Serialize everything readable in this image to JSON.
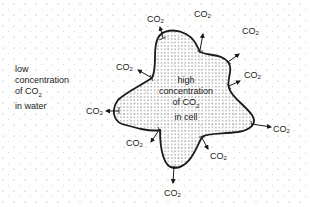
{
  "diagram": {
    "outside_label": {
      "lines": [
        "low",
        "concentration",
        "of CO",
        "in water"
      ],
      "subscript": "2"
    },
    "inside_label": {
      "lines": [
        "high",
        "concentration",
        "of CO",
        "in cell"
      ],
      "subscript": "2"
    },
    "molecule_label": "CO",
    "molecule_subscript": "2",
    "arrows": [
      {
        "id": "top-left",
        "label": "CO2"
      },
      {
        "id": "top",
        "label": "CO2"
      },
      {
        "id": "upper-right",
        "label": "CO2"
      },
      {
        "id": "right",
        "label": "CO2"
      },
      {
        "id": "lower-right",
        "label": "CO2"
      },
      {
        "id": "bottom-right",
        "label": "CO2"
      },
      {
        "id": "bottom",
        "label": "CO2"
      },
      {
        "id": "bottom-left",
        "label": "CO2"
      },
      {
        "id": "left",
        "label": "CO2"
      },
      {
        "id": "upper-left",
        "label": "CO2"
      }
    ],
    "colors": {
      "outline": "#1a1a1a",
      "stipple": "#555555",
      "background_dots": "#9a9a9a"
    }
  }
}
